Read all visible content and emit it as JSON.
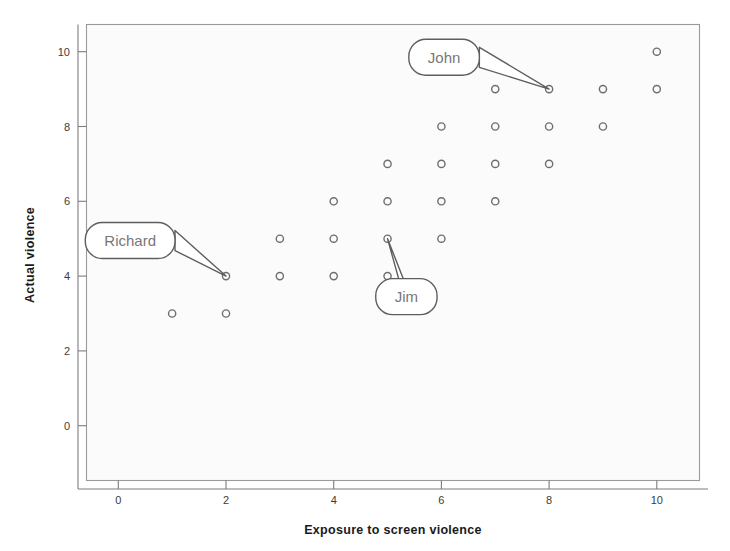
{
  "chart_data": {
    "type": "scatter",
    "title": "",
    "xlabel": "Exposure to screen violence",
    "ylabel": "Actual violence",
    "xlim": [
      -0.5,
      10.8
    ],
    "ylim": [
      -1.2,
      11.0
    ],
    "xticks": [
      "0",
      "2",
      "4",
      "6",
      "8",
      "10"
    ],
    "xtick_values": [
      0,
      2,
      4,
      6,
      8,
      10
    ],
    "yticks": [
      "0",
      "2",
      "4",
      "6",
      "8",
      "10"
    ],
    "ytick_values": [
      0,
      2,
      4,
      6,
      8,
      10
    ],
    "grid": false,
    "legend": "none",
    "marker": "open-circle",
    "marker_color": "#6e6e6e",
    "points": [
      {
        "x": 10,
        "y": 10
      },
      {
        "x": 7,
        "y": 9
      },
      {
        "x": 8,
        "y": 9
      },
      {
        "x": 9,
        "y": 9
      },
      {
        "x": 10,
        "y": 9
      },
      {
        "x": 6,
        "y": 8
      },
      {
        "x": 7,
        "y": 8
      },
      {
        "x": 8,
        "y": 8
      },
      {
        "x": 9,
        "y": 8
      },
      {
        "x": 5,
        "y": 7
      },
      {
        "x": 6,
        "y": 7
      },
      {
        "x": 7,
        "y": 7
      },
      {
        "x": 8,
        "y": 7
      },
      {
        "x": 4,
        "y": 6
      },
      {
        "x": 5,
        "y": 6
      },
      {
        "x": 6,
        "y": 6
      },
      {
        "x": 7,
        "y": 6
      },
      {
        "x": 3,
        "y": 5
      },
      {
        "x": 4,
        "y": 5
      },
      {
        "x": 5,
        "y": 5
      },
      {
        "x": 6,
        "y": 5
      },
      {
        "x": 2,
        "y": 4
      },
      {
        "x": 3,
        "y": 4
      },
      {
        "x": 4,
        "y": 4
      },
      {
        "x": 5,
        "y": 4
      },
      {
        "x": 1,
        "y": 3
      },
      {
        "x": 2,
        "y": 3
      }
    ],
    "annotations": [
      {
        "label": "John",
        "target": {
          "x": 8,
          "y": 9
        },
        "box": {
          "x": 6.05,
          "y": 9.85
        }
      },
      {
        "label": "Richard",
        "target": {
          "x": 2,
          "y": 4
        },
        "box": {
          "x": 0.22,
          "y": 4.95
        }
      },
      {
        "label": "Jim",
        "target": {
          "x": 5,
          "y": 5
        },
        "box": {
          "x": 5.35,
          "y": 3.45
        }
      }
    ]
  },
  "axes": {
    "x_title": "Exposure to screen violence",
    "y_title": "Actual violence"
  },
  "callouts": {
    "john": "John",
    "richard": "Richard",
    "jim": "Jim"
  },
  "colors": {
    "marker": "#6e6e6e",
    "frame": "#9a9a9a",
    "callout_stroke": "#5e5e5e",
    "callout_text": "#777777",
    "axis_title": "#1a1a1a",
    "tick_label": "#3c3c3c",
    "plot_background": "#fbfbfb"
  }
}
